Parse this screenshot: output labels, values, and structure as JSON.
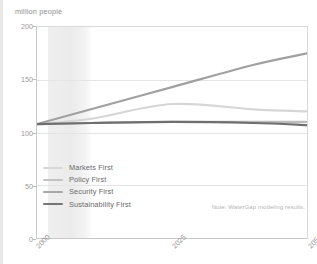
{
  "chart_data": {
    "type": "line",
    "title": "",
    "subtitle": "",
    "ylabel": "million people",
    "xlabel": "",
    "ylim": [
      0,
      200
    ],
    "xlim": [
      2000,
      2050
    ],
    "yticks": [
      0,
      50,
      100,
      150,
      200
    ],
    "ytick_labels": [
      "0",
      "50",
      "100",
      "150",
      "200"
    ],
    "xticks": [
      2000,
      2025,
      2050
    ],
    "xtick_labels": [
      "2000",
      "2025",
      "2050"
    ],
    "grid": true,
    "legend_position": "lower-left-inside",
    "annotations": [
      {
        "name": "source-note",
        "text": "Note: WaterGap modeling results."
      }
    ],
    "shaded_band": {
      "label": "",
      "x_start": 2002,
      "x_end": 2010,
      "color": "#ececec"
    },
    "x": [
      2000,
      2010,
      2025,
      2040,
      2050
    ],
    "series": [
      {
        "name": "Markets First",
        "color": "#d6d6d6",
        "values": [
          108,
          113,
          127,
          122,
          120
        ]
      },
      {
        "name": "Policy First",
        "color": "#bcbcbc",
        "values": [
          108,
          109,
          110,
          110,
          110
        ]
      },
      {
        "name": "Security First",
        "color": "#a0a0a0",
        "values": [
          108,
          122,
          143,
          164,
          175
        ]
      },
      {
        "name": "Sustainability First",
        "color": "#6f6f6f",
        "values": [
          108,
          109,
          110,
          109,
          107
        ]
      }
    ]
  },
  "legend": {
    "items": [
      {
        "label": "Markets First",
        "color": "#d9d9d9"
      },
      {
        "label": "Policy First",
        "color": "#c2c2c2"
      },
      {
        "label": "Security First",
        "color": "#a8a8a8"
      },
      {
        "label": "Sustainability First",
        "color": "#767676"
      }
    ]
  },
  "note": "Note: WaterGap modeling results."
}
